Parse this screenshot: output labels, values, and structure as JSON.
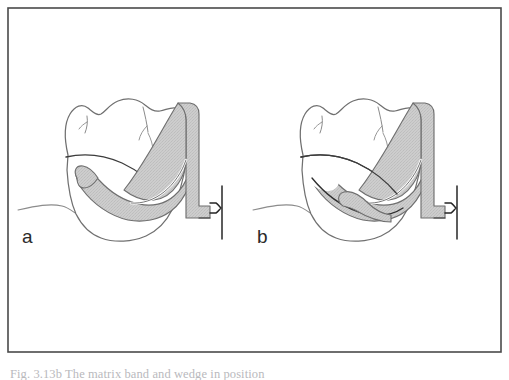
{
  "figure": {
    "background_color": "#ffffff",
    "frame": {
      "stroke_color": "#4a4a4a",
      "stroke_width": 1.6,
      "x": 8,
      "y": 8,
      "width": 493,
      "height": 344
    },
    "panels": [
      {
        "id": "panel-a",
        "label": "a",
        "label_x": 22,
        "label_y": 243,
        "offset_x": 0,
        "band_terminus": "higher-left",
        "description": "Molar tooth with proximal cavity preparation and matrix band, band terminus positioned higher and more mesially"
      },
      {
        "id": "panel-b",
        "label": "b",
        "label_x": 257,
        "label_y": 243,
        "offset_x": 235,
        "band_terminus": "lower-right",
        "description": "Molar tooth with proximal cavity preparation and matrix band, band terminus positioned lower and more distally"
      }
    ],
    "colors": {
      "outline": "#6e6e6e",
      "outline_dark": "#3a3a3a",
      "band_fill": "#c9c9c9",
      "band_stroke": "#6a6a6a",
      "wedge_line": "#2e2e2e",
      "gingiva_line": "#8a8a8a",
      "label_text": "#2a2a2a"
    },
    "caption_partial": "Fig. 3.13b  The matrix band and wedge in position"
  }
}
